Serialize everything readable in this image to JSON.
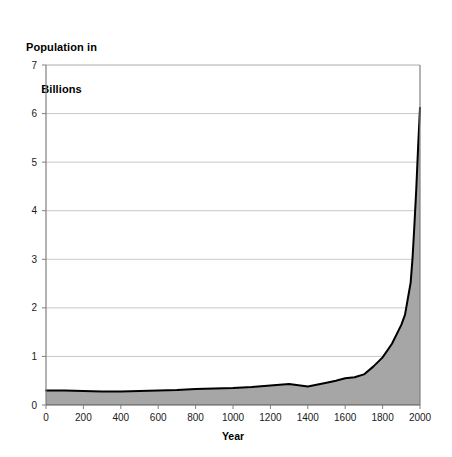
{
  "chart_data": {
    "type": "area",
    "title": "Population in Billions",
    "title_line1": "Population in",
    "title_line2": "Billions",
    "xlabel": "Year",
    "ylabel": "",
    "xlim": [
      0,
      2000
    ],
    "ylim": [
      0,
      7
    ],
    "xticks": [
      0,
      200,
      400,
      600,
      800,
      1000,
      1200,
      1400,
      1600,
      1800,
      2000
    ],
    "yticks": [
      0,
      1,
      2,
      3,
      4,
      5,
      6,
      7
    ],
    "xtick_labels": [
      "0",
      "200",
      "400",
      "600",
      "800",
      "1000",
      "1200",
      "1400",
      "1600",
      "1800",
      "2000"
    ],
    "ytick_labels": [
      "0",
      "1",
      "2",
      "3",
      "4",
      "5",
      "6",
      "7"
    ],
    "grid": "horizontal",
    "legend": "none",
    "series": [
      {
        "name": "World Population",
        "fill_color": "#a6a6a6",
        "line_color": "#000000",
        "x": [
          0,
          100,
          200,
          300,
          400,
          500,
          600,
          700,
          800,
          900,
          1000,
          1100,
          1200,
          1300,
          1400,
          1500,
          1550,
          1600,
          1650,
          1700,
          1750,
          1800,
          1850,
          1900,
          1920,
          1940,
          1950,
          1960,
          1970,
          1980,
          1990,
          2000
        ],
        "values": [
          0.3,
          0.3,
          0.29,
          0.28,
          0.28,
          0.29,
          0.3,
          0.31,
          0.33,
          0.34,
          0.35,
          0.37,
          0.4,
          0.43,
          0.38,
          0.46,
          0.5,
          0.55,
          0.57,
          0.63,
          0.79,
          0.98,
          1.26,
          1.65,
          1.86,
          2.3,
          2.52,
          3.02,
          3.7,
          4.44,
          5.32,
          6.12
        ]
      }
    ]
  },
  "colors": {
    "area_fill": "#a6a6a6",
    "line": "#000000",
    "gridline": "#c8c8c8",
    "axis": "#808080",
    "background": "#ffffff"
  }
}
